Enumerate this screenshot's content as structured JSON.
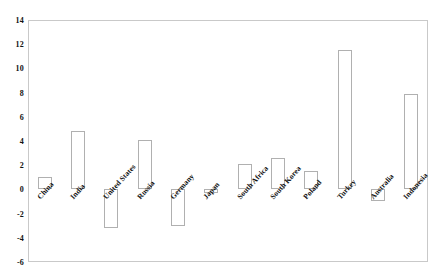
{
  "chart_data": {
    "type": "bar",
    "title": "",
    "subtitle": "",
    "xlabel": "",
    "ylabel": "",
    "ylim": [
      -6,
      14
    ],
    "y_ticks": [
      14,
      12,
      10,
      8,
      6,
      4,
      2,
      0,
      -2,
      -4,
      -6
    ],
    "y_tick_labels": [
      "14",
      "12",
      "10",
      "8",
      "6",
      "4",
      "2",
      "0",
      "-2",
      "-4",
      "-6"
    ],
    "grid": false,
    "legend": false,
    "legend_position": "none",
    "bar_style": {
      "fill": "#ffffff",
      "edge": "#b0b0b0"
    },
    "categories": [
      "China",
      "India",
      "United States",
      "Russia",
      "Germany",
      "Japan",
      "South Africa",
      "South Korea",
      "Poland",
      "Turkey",
      "Australia",
      "Indonesia"
    ],
    "values": [
      1.0,
      4.8,
      -3.2,
      4.1,
      -3.0,
      -0.3,
      2.1,
      2.6,
      1.5,
      11.5,
      -1.0,
      7.9
    ]
  }
}
